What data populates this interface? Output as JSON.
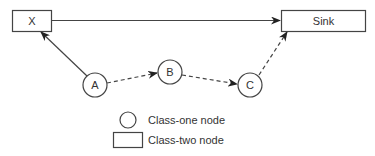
{
  "diagram": {
    "nodes": [
      {
        "id": "X",
        "label": "X",
        "type": "class-two",
        "shape": "rectangle"
      },
      {
        "id": "Sink",
        "label": "Sink",
        "type": "class-two",
        "shape": "rectangle"
      },
      {
        "id": "A",
        "label": "A",
        "type": "class-one",
        "shape": "circle"
      },
      {
        "id": "B",
        "label": "B",
        "type": "class-one",
        "shape": "circle"
      },
      {
        "id": "C",
        "label": "C",
        "type": "class-one",
        "shape": "circle"
      }
    ],
    "edges": [
      {
        "from": "X",
        "to": "Sink",
        "style": "solid"
      },
      {
        "from": "A",
        "to": "X",
        "style": "solid"
      },
      {
        "from": "A",
        "to": "B",
        "style": "dashed"
      },
      {
        "from": "B",
        "to": "C",
        "style": "dashed"
      },
      {
        "from": "C",
        "to": "Sink",
        "style": "dashed"
      }
    ]
  },
  "legend": {
    "class_one_label": "Class-one node",
    "class_two_label": "Class-two node"
  },
  "colors": {
    "stroke": "#444444",
    "text": "#333333",
    "background": "#ffffff"
  }
}
